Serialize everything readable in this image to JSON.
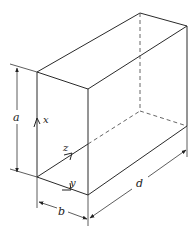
{
  "figure": {
    "dimension_labels": {
      "height": "a",
      "width": "b",
      "depth": "d"
    },
    "axis_labels": {
      "x": "x",
      "y": "y",
      "z": "z"
    },
    "colors": {
      "line": "#2a2a2a",
      "background": "#ffffff"
    }
  }
}
